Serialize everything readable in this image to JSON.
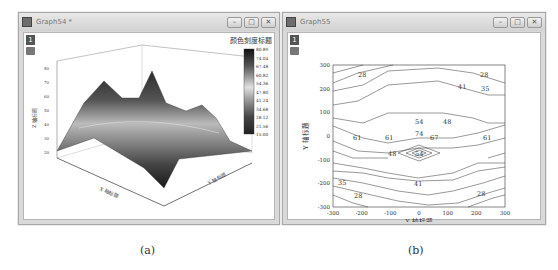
{
  "windows": [
    {
      "title": "Graph54 *",
      "layer": "1",
      "controls": {
        "minimize": "–",
        "restore": "□",
        "close": "✕"
      },
      "colorbar": {
        "title": "颜色刻度标题",
        "ticks": [
          "80.89",
          "74.04",
          "67.48",
          "60.82",
          "54.36",
          "47.80",
          "41.24",
          "34.68",
          "28.12",
          "21.56",
          "15.00"
        ]
      },
      "z_axis": {
        "title": "Z 轴标题",
        "ticks": [
          "20",
          "30",
          "40",
          "50",
          "60",
          "70",
          "80"
        ]
      },
      "x_axis": {
        "title": "X 轴标题",
        "ticks": [
          "-300",
          "-200",
          "-100",
          "0",
          "100",
          "200",
          "300"
        ]
      },
      "y_axis": {
        "title": "Y 轴标题",
        "ticks": [
          "-300",
          "-200",
          "-100",
          "0",
          "100",
          "200",
          "300"
        ]
      },
      "caption": "(a)"
    },
    {
      "title": "Graph55",
      "layer": "1",
      "controls": {
        "minimize": "–",
        "restore": "□",
        "close": "✕"
      },
      "x_axis": {
        "title": "X 轴标题",
        "ticks": [
          "-300",
          "-200",
          "-100",
          "0",
          "100",
          "200",
          "300"
        ]
      },
      "y_axis": {
        "title": "Y 轴标题",
        "ticks": [
          "300",
          "200",
          "100",
          "0",
          "-100",
          "-200",
          "-300"
        ]
      },
      "contour_labels": [
        "28",
        "41",
        "28",
        "35",
        "54",
        "48",
        "61",
        "61",
        "74",
        "67",
        "61",
        "48",
        "54",
        "35",
        "41",
        "28",
        "28"
      ],
      "caption": "(b)"
    }
  ]
}
